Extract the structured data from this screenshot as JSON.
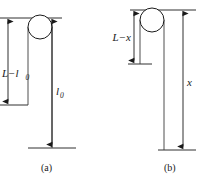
{
  "figure": {
    "type": "physics-diagram",
    "panels": [
      {
        "id": "a",
        "caption": "(a)",
        "pulley": {
          "name": "pulley-circle",
          "cx": 40,
          "cy": 27,
          "r": 12
        },
        "measurements": [
          {
            "name": "left-segment",
            "label": "L−l",
            "label_base": "L−l",
            "subscript": "0",
            "full_label": "L−l₀",
            "x": 8,
            "y_top": 18,
            "y_bottom": 105,
            "arrow_heads": "both",
            "label_x": 14,
            "label_y": 74
          },
          {
            "name": "right-segment",
            "label_base": "l",
            "subscript": "0",
            "full_label": "l₀",
            "x": 52,
            "y_top": 18,
            "y_bottom": 148,
            "arrow_heads": "both",
            "label_x": 56,
            "label_y": 92
          }
        ],
        "reference_lines": [
          {
            "name": "top-reference-line",
            "x1": 0,
            "x2": 62,
            "y": 18
          },
          {
            "name": "left-bottom-tick",
            "x1": 0,
            "x2": 28,
            "y": 105
          },
          {
            "name": "right-bottom-tick",
            "x1": 28,
            "x2": 76,
            "y": 148
          }
        ],
        "rope": [
          {
            "name": "rope-left-strand",
            "x": 28,
            "y_top": 27,
            "y_bottom": 105
          },
          {
            "name": "rope-right-strand",
            "x": 52,
            "y_top": 27,
            "y_bottom": 148
          }
        ],
        "caption_x": 47,
        "caption_y": 168
      },
      {
        "id": "b",
        "caption": "(b)",
        "pulley": {
          "name": "pulley-circle",
          "cx": 152,
          "cy": 20,
          "r": 12
        },
        "measurements": [
          {
            "name": "left-segment",
            "label_base": "L−x",
            "subscript": "",
            "full_label": "L−x",
            "x": 134,
            "y_top": 10,
            "y_bottom": 64,
            "arrow_heads": "both",
            "label_x": 140,
            "label_y": 41
          },
          {
            "name": "right-segment",
            "label_base": "x",
            "subscript": "",
            "full_label": "x",
            "x": 183,
            "y_top": 10,
            "y_bottom": 150,
            "arrow_heads": "both",
            "label_x": 187,
            "label_y": 83
          }
        ],
        "reference_lines": [
          {
            "name": "top-reference-line",
            "x1": 130,
            "x2": 196,
            "y": 10
          },
          {
            "name": "left-bottom-tick",
            "x1": 128,
            "x2": 152,
            "y": 64
          },
          {
            "name": "right-bottom-tick",
            "x1": 158,
            "x2": 196,
            "y": 150
          }
        ],
        "rope": [
          {
            "name": "rope-left-strand",
            "x": 140,
            "y_top": 20,
            "y_bottom": 64
          },
          {
            "name": "rope-right-strand",
            "x": 164,
            "y_top": 20,
            "y_bottom": 150
          }
        ],
        "caption_x": 170,
        "caption_y": 168
      }
    ],
    "colors": {
      "stroke": "#1a1a1a",
      "rope": "#3a3a3a",
      "background": "#ffffff",
      "text": "#1a1a1a"
    }
  }
}
